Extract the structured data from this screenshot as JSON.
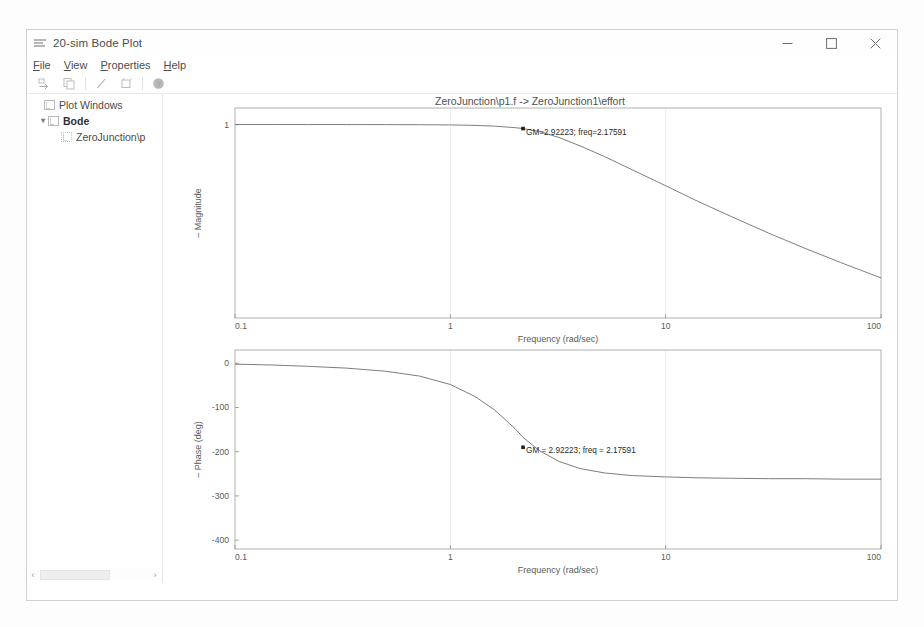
{
  "window": {
    "title": "20-sim Bode Plot",
    "app_icon": "bode-app-icon",
    "controls": {
      "minimize": "minimize-button",
      "maximize": "maximize-button",
      "close": "close-button"
    }
  },
  "menubar": {
    "items": [
      {
        "label": "File",
        "mnemonic": "F"
      },
      {
        "label": "View",
        "mnemonic": "V"
      },
      {
        "label": "Properties",
        "mnemonic": "P"
      },
      {
        "label": "Help",
        "mnemonic": "H"
      }
    ]
  },
  "toolbar": {
    "buttons": [
      {
        "name": "save-icon",
        "tooltip": "Save"
      },
      {
        "name": "copy-icon",
        "tooltip": "Copy"
      },
      {
        "name": "line-tool-icon",
        "tooltip": "Line"
      },
      {
        "name": "zoom-rect-icon",
        "tooltip": "Zoom"
      },
      {
        "name": "help-icon",
        "tooltip": "Help"
      }
    ]
  },
  "tree": {
    "root_label": "Plot Windows",
    "items": [
      {
        "label": "Bode",
        "level": 1,
        "bold": true,
        "expanded": true
      },
      {
        "label": "ZeroJunction\\p",
        "level": 2,
        "bold": false,
        "expanded": false
      }
    ],
    "scrollbar": {
      "left_arrow": "‹",
      "right_arrow": "›"
    }
  },
  "chart_data": [
    {
      "type": "line",
      "name": "magnitude-plot",
      "title": "ZeroJunction\\p1.f -> ZeroJunction1\\effort",
      "xlabel": "Frequency (rad/sec)",
      "ylabel": "Magnitude",
      "xscale": "log",
      "yscale": "log",
      "xlim": [
        0.1,
        100
      ],
      "ylim": [
        0.03,
        1.35
      ],
      "xticks": [
        "0.1",
        "1",
        "10",
        "100"
      ],
      "xtick_values": [
        0.1,
        1,
        10,
        100
      ],
      "yticks": [
        "1"
      ],
      "ytick_values": [
        1
      ],
      "grid": true,
      "annotation": {
        "text": "GM=2.92223; freq=2.17591",
        "x": 2.17591,
        "y": 0.93
      },
      "x": [
        0.1,
        0.15,
        0.22,
        0.33,
        0.5,
        0.72,
        1.0,
        1.3,
        1.6,
        2.0,
        2.18,
        2.6,
        3.2,
        4.0,
        5.2,
        7.0,
        10.0,
        14.0,
        20.0,
        30.0,
        45.0,
        65.0,
        100.0
      ],
      "y": [
        1.0,
        1.0,
        1.0,
        1.0,
        0.999,
        0.997,
        0.993,
        0.985,
        0.972,
        0.945,
        0.93,
        0.88,
        0.79,
        0.68,
        0.56,
        0.44,
        0.33,
        0.25,
        0.19,
        0.14,
        0.105,
        0.082,
        0.062
      ]
    },
    {
      "type": "line",
      "name": "phase-plot",
      "title": "",
      "xlabel": "Frequency (rad/sec)",
      "ylabel": "Phase (deg)",
      "xscale": "log",
      "yscale": "linear",
      "xlim": [
        0.1,
        100
      ],
      "ylim": [
        -420,
        30
      ],
      "xticks": [
        "0.1",
        "1",
        "10",
        "100"
      ],
      "xtick_values": [
        0.1,
        1,
        10,
        100
      ],
      "yticks": [
        "0",
        "-100",
        "-200",
        "-300",
        "-400"
      ],
      "ytick_values": [
        0,
        -100,
        -200,
        -300,
        -400
      ],
      "grid": true,
      "annotation": {
        "text": "GM = 2.92223; freq = 2.17591",
        "x": 2.17591,
        "y": -190
      },
      "x": [
        0.1,
        0.15,
        0.22,
        0.33,
        0.5,
        0.72,
        1.0,
        1.3,
        1.6,
        2.0,
        2.18,
        2.6,
        3.2,
        4.0,
        5.2,
        7.0,
        10.0,
        14.0,
        20.0,
        30.0,
        45.0,
        65.0,
        100.0
      ],
      "y": [
        -2,
        -4,
        -7,
        -11,
        -18,
        -29,
        -48,
        -75,
        -105,
        -148,
        -168,
        -198,
        -222,
        -238,
        -248,
        -254,
        -257,
        -259,
        -260,
        -261,
        -261,
        -262,
        -262
      ]
    }
  ]
}
